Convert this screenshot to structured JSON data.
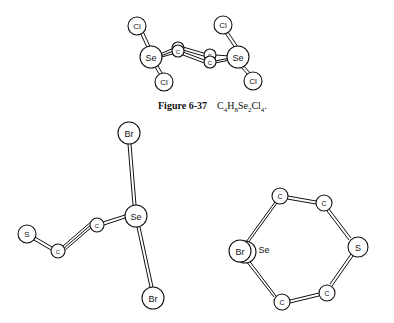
{
  "figure_top": {
    "caption_label": "Figure 6-37",
    "formula": {
      "parts": [
        {
          "t": "C",
          "s": "4"
        },
        {
          "t": "H",
          "s": "8"
        },
        {
          "t": "Se",
          "s": "2"
        },
        {
          "t": "Cl",
          "s": "4"
        }
      ],
      "suffix": "."
    },
    "atoms": [
      {
        "id": "cl1",
        "label": "Cl",
        "x": 137,
        "y": 26,
        "r": 9
      },
      {
        "id": "se1",
        "label": "Se",
        "x": 151,
        "y": 57,
        "r": 11
      },
      {
        "id": "cl2",
        "label": "Cl",
        "x": 164,
        "y": 82,
        "r": 9
      },
      {
        "id": "c1a",
        "label": "C",
        "x": 178,
        "y": 48,
        "r": 6
      },
      {
        "id": "c1b",
        "label": "C",
        "x": 178,
        "y": 51,
        "r": 6
      },
      {
        "id": "c2a",
        "label": "C",
        "x": 210,
        "y": 55,
        "r": 6
      },
      {
        "id": "c2b",
        "label": "C",
        "x": 210,
        "y": 62,
        "r": 6
      },
      {
        "id": "se2",
        "label": "Se",
        "x": 238,
        "y": 57,
        "r": 11
      },
      {
        "id": "cl3",
        "label": "Cl",
        "x": 223,
        "y": 25,
        "r": 9
      },
      {
        "id": "cl4",
        "label": "Cl",
        "x": 253,
        "y": 81,
        "r": 9
      }
    ]
  },
  "figure_bottom_left": {
    "atoms": [
      {
        "id": "br1",
        "label": "Br",
        "x": 129,
        "y": 133,
        "r": 11
      },
      {
        "id": "se",
        "label": "Se",
        "x": 136,
        "y": 216,
        "r": 11
      },
      {
        "id": "c1",
        "label": "C",
        "x": 97,
        "y": 225,
        "r": 7
      },
      {
        "id": "c2",
        "label": "C",
        "x": 58,
        "y": 251,
        "r": 7
      },
      {
        "id": "s",
        "label": "S",
        "x": 27,
        "y": 234,
        "r": 9
      },
      {
        "id": "br2",
        "label": "Br",
        "x": 153,
        "y": 298,
        "r": 11
      }
    ]
  },
  "figure_bottom_right": {
    "atoms": [
      {
        "id": "c_top",
        "label": "C",
        "x": 280,
        "y": 196,
        "r": 8
      },
      {
        "id": "c_topr",
        "label": "C",
        "x": 324,
        "y": 203,
        "r": 8
      },
      {
        "id": "s",
        "label": "S",
        "x": 358,
        "y": 247,
        "r": 10
      },
      {
        "id": "c_botr",
        "label": "C",
        "x": 327,
        "y": 293,
        "r": 8
      },
      {
        "id": "c_bot",
        "label": "C",
        "x": 282,
        "y": 302,
        "r": 8
      },
      {
        "id": "br",
        "label": "Br",
        "x": 240,
        "y": 251,
        "r": 11
      }
    ],
    "se_label": "Se"
  }
}
